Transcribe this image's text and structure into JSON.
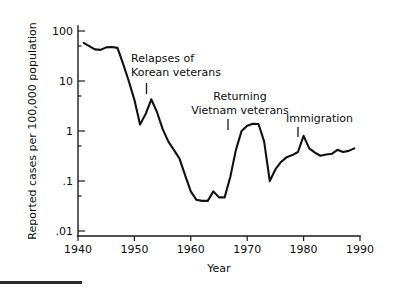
{
  "figure": {
    "background_color": "#ffffff",
    "line_color": "#111111",
    "axis_color": "#1a1a1a",
    "bottom_rule_label": "bottom-rule"
  },
  "chart_data": {
    "type": "line",
    "title": "",
    "xlabel": "Year",
    "ylabel": "Reported cases per 100,000 population",
    "xlim": [
      1940,
      1990
    ],
    "ylim": [
      0.01,
      200
    ],
    "yscale": "log",
    "grid": false,
    "legend": "none",
    "xticks": [
      1940,
      1950,
      1960,
      1970,
      1980,
      1990
    ],
    "xticklabels": [
      "1940",
      "1950",
      "1960",
      "1970",
      "1980",
      "1990"
    ],
    "yticks": [
      0.01,
      0.1,
      1,
      10,
      100
    ],
    "yticklabels": [
      ".01",
      ".1",
      "1",
      "10",
      "100"
    ],
    "x": [
      1941,
      1942,
      1943,
      1944,
      1945,
      1946,
      1947,
      1948,
      1949,
      1950,
      1951,
      1952,
      1953,
      1954,
      1955,
      1956,
      1957,
      1958,
      1959,
      1960,
      1961,
      1962,
      1963,
      1964,
      1965,
      1966,
      1967,
      1968,
      1969,
      1970,
      1971,
      1972,
      1973,
      1974,
      1975,
      1976,
      1977,
      1978,
      1979,
      1980,
      1981,
      1982,
      1983,
      1984,
      1985,
      1986,
      1987,
      1988,
      1989
    ],
    "values": [
      58,
      50,
      43,
      42,
      47,
      48,
      46,
      22,
      10,
      4.2,
      1.35,
      2.2,
      4.3,
      2.4,
      1.1,
      0.62,
      0.42,
      0.28,
      0.13,
      0.062,
      0.042,
      0.04,
      0.04,
      0.062,
      0.047,
      0.047,
      0.12,
      0.42,
      1.0,
      1.28,
      1.4,
      1.38,
      0.62,
      0.1,
      0.17,
      0.24,
      0.3,
      0.33,
      0.38,
      0.8,
      0.45,
      0.37,
      0.32,
      0.34,
      0.35,
      0.42,
      0.38,
      0.4,
      0.45
    ],
    "series_name": "Reported cases per 100,000 population",
    "annotations": [
      {
        "id": "korean-veterans",
        "lines": [
          "Relapses of",
          "Korean  veterans"
        ],
        "text": "Relapses of Korean veterans",
        "pointer_year": 1952,
        "pointer_value": 4.3
      },
      {
        "id": "vietnam-veterans",
        "lines": [
          "Returning",
          "Vietnam veterans"
        ],
        "text": "Returning Vietnam veterans",
        "pointer_year": 1967,
        "pointer_value": 1.0
      },
      {
        "id": "immigration",
        "lines": [
          "Immigration"
        ],
        "text": "Immigration",
        "pointer_year": 1979,
        "pointer_value": 0.8
      }
    ]
  }
}
